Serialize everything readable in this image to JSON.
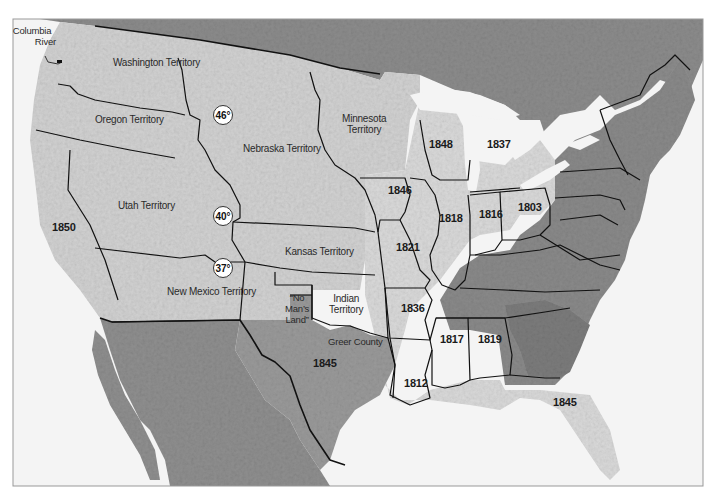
{
  "map": {
    "frame": {
      "x": 13,
      "y": 19,
      "width": 690,
      "height": 467
    },
    "colors": {
      "background": "#ffffff",
      "water": "#f4f4f4",
      "us_land_light": "#d9d9d9",
      "territory_light": "#cfcfcf",
      "foreign_dark": "#8e8e8e",
      "east_dark": "#8a8a8a",
      "south_dark": "#7c7c7c",
      "boundary": "#111111"
    },
    "callout": {
      "title_line1": "Columbia",
      "title_line2": "River"
    },
    "territories": [
      {
        "id": "washington",
        "label": "Washington Territory",
        "x": 152,
        "y": 63
      },
      {
        "id": "oregon",
        "label": "Oregon Territory",
        "x": 118,
        "y": 120
      },
      {
        "id": "nebraska",
        "label": "Nebraska Territory",
        "x": 298,
        "y": 148
      },
      {
        "id": "minnesota",
        "label_line1": "Minnesota",
        "label_line2": "Territory",
        "x": 363,
        "y": 118
      },
      {
        "id": "utah",
        "label": "Utah Territory",
        "x": 154,
        "y": 206
      },
      {
        "id": "kansas",
        "label": "Kansas Territory",
        "x": 320,
        "y": 251
      },
      {
        "id": "new_mexico",
        "label": "New Mexico Territory",
        "x": 200,
        "y": 291
      },
      {
        "id": "indian",
        "label_line1": "Indian",
        "label_line2": "Territory",
        "x": 347,
        "y": 298
      },
      {
        "id": "no_mans_land",
        "label_line1": "“No",
        "label_line2": "Man’s",
        "label_line3": "Land”",
        "x": 296,
        "y": 294
      },
      {
        "id": "greer_county",
        "label": "Greer County",
        "x": 347,
        "y": 341
      }
    ],
    "statehood_years": [
      {
        "state": "California",
        "year": "1850",
        "x": 61,
        "y": 228
      },
      {
        "state": "Iowa",
        "year": "1846",
        "x": 397,
        "y": 191
      },
      {
        "state": "Wisconsin",
        "year": "1848",
        "x": 438,
        "y": 145
      },
      {
        "state": "Michigan",
        "year": "1837",
        "x": 496,
        "y": 145
      },
      {
        "state": "Illinois",
        "year": "1818",
        "x": 448,
        "y": 218
      },
      {
        "state": "Indiana",
        "year": "1816",
        "x": 488,
        "y": 214
      },
      {
        "state": "Ohio",
        "year": "1803",
        "x": 527,
        "y": 207
      },
      {
        "state": "Missouri",
        "year": "1821",
        "x": 405,
        "y": 248
      },
      {
        "state": "Arkansas",
        "year": "1836",
        "x": 410,
        "y": 308
      },
      {
        "state": "Texas",
        "year": "1845",
        "x": 322,
        "y": 363
      },
      {
        "state": "Louisiana",
        "year": "1812",
        "x": 413,
        "y": 383
      },
      {
        "state": "Mississippi",
        "year": "1817",
        "x": 449,
        "y": 339
      },
      {
        "state": "Alabama",
        "year": "1819",
        "x": 487,
        "y": 339
      },
      {
        "state": "Florida",
        "year": "1845",
        "x": 562,
        "y": 403
      }
    ],
    "latitude_markers": [
      {
        "label": "46°",
        "x": 223,
        "y": 115
      },
      {
        "label": "40°",
        "x": 223,
        "y": 216
      },
      {
        "label": "37°",
        "x": 223,
        "y": 268
      }
    ]
  }
}
